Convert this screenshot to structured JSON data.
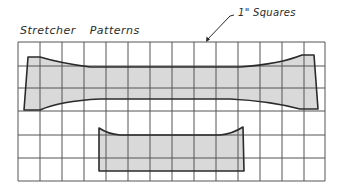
{
  "figure": {
    "title_word1": "Stretcher",
    "title_word2": "Patterns",
    "callout_label": "1\" Squares",
    "colors": {
      "background": "#ffffff",
      "grid_line": "#555555",
      "pattern_fill": "#d9d9d9",
      "pattern_outline": "#2b2b2b",
      "text": "#2a2a2a"
    },
    "grid": {
      "columns": 14,
      "rows": 6,
      "unit": "1 inch squares"
    },
    "patterns": [
      {
        "name": "large-stretcher-pattern",
        "description": "Long stretcher with flared ends, spanning ~13 squares"
      },
      {
        "name": "small-stretcher-pattern",
        "description": "Shorter stretcher with flared ends, spanning ~6 squares"
      }
    ]
  }
}
